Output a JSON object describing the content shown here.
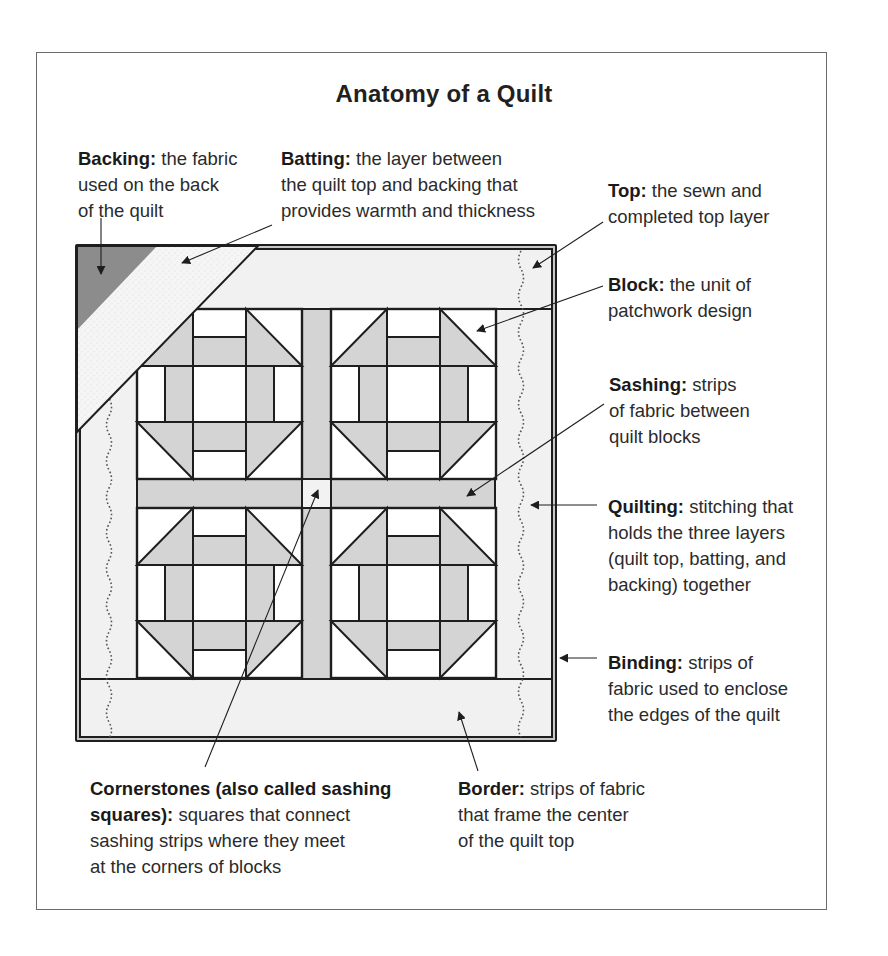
{
  "title": "Anatomy of a Quilt",
  "labels": {
    "backing": {
      "term": "Backing:",
      "line1": " the fabric",
      "line2": "used on the back",
      "line3": "of the quilt"
    },
    "batting": {
      "term": "Batting:",
      "line1": " the layer between",
      "line2": "the quilt top and backing that",
      "line3": "provides warmth and thickness"
    },
    "top": {
      "term": "Top:",
      "line1": " the sewn and",
      "line2": "completed top layer"
    },
    "block": {
      "term": "Block:",
      "line1": " the unit of",
      "line2": "patchwork design"
    },
    "sashing": {
      "term": "Sashing:",
      "line1": " strips",
      "line2": "of fabric between",
      "line3": "quilt blocks"
    },
    "quilting": {
      "term": "Quilting:",
      "line1": " stitching that",
      "line2": "holds the three layers",
      "line3": "(quilt top, batting, and",
      "line4": "backing) together"
    },
    "binding": {
      "term": "Binding:",
      "line1": " strips of",
      "line2": "fabric used to enclose",
      "line3": "the edges of the quilt"
    },
    "cornerstones": {
      "term1": "Cornerstones (also called sashing",
      "term2": "squares):",
      "line2": " squares that connect",
      "line3": "sashing strips where they meet",
      "line4": "at the corners of blocks"
    },
    "border": {
      "term": "Border:",
      "line1": " strips of fabric",
      "line2": "that frame the center",
      "line3": "of the quilt top"
    }
  },
  "colors": {
    "outline": "#1e1e1e",
    "fabric_gray": "#d4d4d4",
    "border_light": "#f1f1f1",
    "backing_dark": "#8c8c8c",
    "batting_speckle": "#f4f4f4",
    "white": "#ffffff"
  },
  "icons": [
    "arrow-pointer-icon",
    "quilting-stitch-line"
  ]
}
